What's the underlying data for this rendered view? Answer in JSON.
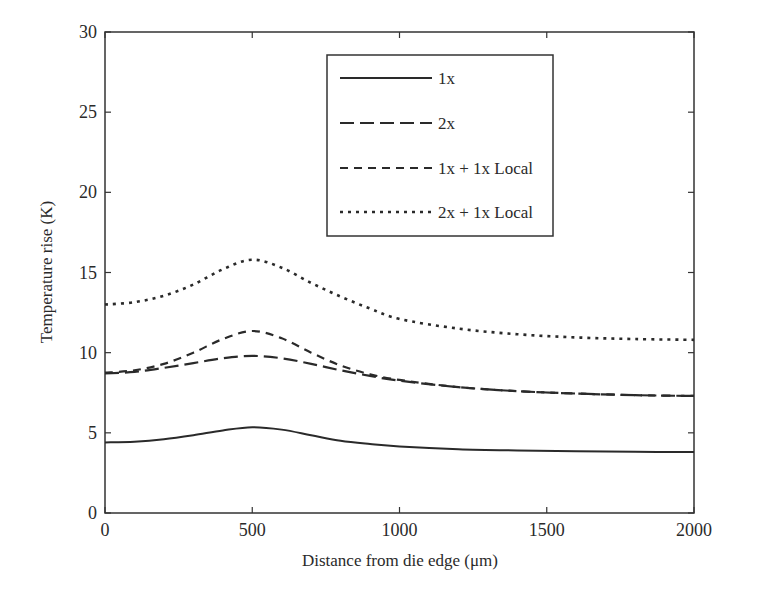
{
  "chart_data": {
    "type": "line",
    "title": "",
    "xlabel": "Distance from die edge (μm)",
    "ylabel": "Temperature rise (K)",
    "xlim": [
      0,
      2000
    ],
    "ylim": [
      0,
      30
    ],
    "xticks": [
      0,
      500,
      1000,
      1500,
      2000
    ],
    "yticks": [
      0,
      5,
      10,
      15,
      20,
      25,
      30
    ],
    "grid": false,
    "legend_position": "upper center",
    "x": [
      0,
      100,
      200,
      300,
      400,
      500,
      600,
      700,
      800,
      900,
      1000,
      1200,
      1400,
      1600,
      1800,
      2000
    ],
    "series": [
      {
        "name": "1x",
        "style": "solid",
        "values": [
          4.4,
          4.45,
          4.6,
          4.85,
          5.15,
          5.35,
          5.2,
          4.85,
          4.5,
          4.3,
          4.15,
          3.98,
          3.9,
          3.85,
          3.82,
          3.8
        ]
      },
      {
        "name": "2x",
        "style": "long-dash",
        "values": [
          8.7,
          8.8,
          9.05,
          9.35,
          9.65,
          9.8,
          9.65,
          9.3,
          8.9,
          8.55,
          8.25,
          7.85,
          7.6,
          7.45,
          7.35,
          7.3
        ]
      },
      {
        "name": "1x + 1x Local",
        "style": "short-dash",
        "values": [
          8.75,
          8.9,
          9.3,
          10.0,
          10.85,
          11.35,
          10.9,
          10.0,
          9.2,
          8.65,
          8.3,
          7.85,
          7.6,
          7.45,
          7.35,
          7.3
        ]
      },
      {
        "name": "2x + 1x Local",
        "style": "dotted",
        "values": [
          13.0,
          13.15,
          13.55,
          14.25,
          15.2,
          15.8,
          15.3,
          14.35,
          13.5,
          12.75,
          12.1,
          11.5,
          11.15,
          10.95,
          10.85,
          10.8
        ]
      }
    ]
  },
  "legend": {
    "items": [
      "1x",
      "2x",
      "1x + 1x Local",
      "2x + 1x Local"
    ]
  }
}
